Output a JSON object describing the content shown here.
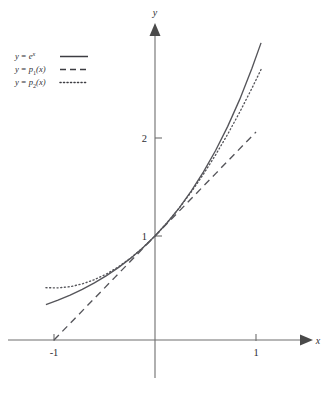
{
  "figure": {
    "kind": "function-plot",
    "background": "#ffffff",
    "ink_color": "#55555a",
    "axis_color": "#6e6e6e"
  },
  "axes": {
    "x_axis_label": "x",
    "y_axis_label": "y",
    "x_ticks": [
      {
        "value": -1,
        "label": "-1"
      },
      {
        "value": 1,
        "label": "1"
      }
    ],
    "y_ticks": [
      {
        "value": 1,
        "label": "1"
      },
      {
        "value": 2,
        "label": "2"
      }
    ],
    "x_range": [
      -1.45,
      1.55
    ],
    "y_range": [
      -0.55,
      3.25
    ],
    "grid": false,
    "origin_px": {
      "x": 155,
      "y": 340
    },
    "unit_px": {
      "x": 101,
      "y": 104
    }
  },
  "legend": {
    "position": "top-left",
    "entries": [
      {
        "id": "exp",
        "style": "solid",
        "lhs": "y",
        "eq": "=",
        "base": "e",
        "sup": "x",
        "sub": "",
        "arg": "",
        "text": "y = e^x"
      },
      {
        "id": "p1",
        "style": "dashed",
        "lhs": "y",
        "eq": "=",
        "base": "p",
        "sup": "",
        "sub": "1",
        "arg": "(x)",
        "text": "y = p1(x)"
      },
      {
        "id": "p2",
        "style": "dotted",
        "lhs": "y",
        "eq": "=",
        "base": "p",
        "sup": "",
        "sub": "2",
        "arg": "(x)",
        "text": "y = p2(x)"
      }
    ]
  },
  "chart_data": {
    "type": "line",
    "title": "",
    "subtitle": "",
    "xlabel": "x",
    "ylabel": "y",
    "xlim": [
      -1.45,
      1.55
    ],
    "ylim": [
      -0.55,
      3.25
    ],
    "grid": false,
    "legend_position": "top-left",
    "xticks": [
      -1,
      1
    ],
    "xticklabels": [
      "-1",
      "1"
    ],
    "yticks": [
      1,
      2
    ],
    "yticklabels": [
      "1",
      "2"
    ],
    "annotations": [],
    "series": [
      {
        "name": "y = e^x",
        "formula": "exp(x)",
        "style": "solid",
        "color": "#55555a",
        "x": [
          -1.08,
          -0.96,
          -0.84,
          -0.72,
          -0.6,
          -0.48,
          -0.36,
          -0.24,
          -0.12,
          0.0,
          0.12,
          0.24,
          0.36,
          0.48,
          0.6,
          0.72,
          0.84,
          0.96,
          1.05
        ],
        "y": [
          0.34,
          0.383,
          0.432,
          0.487,
          0.549,
          0.619,
          0.698,
          0.787,
          0.887,
          1.0,
          1.127,
          1.271,
          1.433,
          1.616,
          1.822,
          2.054,
          2.316,
          2.612,
          2.857
        ]
      },
      {
        "name": "y = p1(x)",
        "formula": "1 + x",
        "style": "dashed",
        "color": "#55555a",
        "x": [
          -1.0,
          -0.8,
          -0.6,
          -0.4,
          -0.2,
          0.0,
          0.2,
          0.4,
          0.6,
          0.8,
          1.0
        ],
        "y": [
          0.0,
          0.2,
          0.4,
          0.6,
          0.8,
          1.0,
          1.2,
          1.4,
          1.6,
          1.8,
          2.0
        ]
      },
      {
        "name": "y = p2(x)",
        "formula": "1 + x + x^2/2",
        "style": "dotted",
        "color": "#55555a",
        "x": [
          -1.08,
          -0.96,
          -0.84,
          -0.72,
          -0.6,
          -0.48,
          -0.36,
          -0.24,
          -0.12,
          0.0,
          0.12,
          0.24,
          0.36,
          0.48,
          0.6,
          0.72,
          0.84,
          0.96,
          1.05
        ],
        "y": [
          0.503,
          0.501,
          0.513,
          0.539,
          0.58,
          0.635,
          0.705,
          0.789,
          0.887,
          1.0,
          1.127,
          1.269,
          1.425,
          1.595,
          1.78,
          1.979,
          2.193,
          2.421,
          2.601
        ]
      }
    ]
  }
}
